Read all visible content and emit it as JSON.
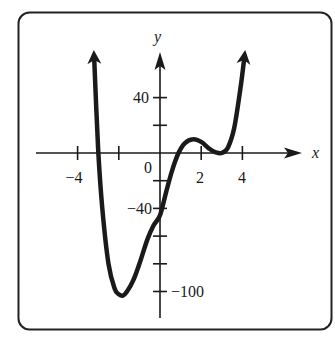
{
  "chart_data": {
    "type": "line",
    "title": "",
    "xlabel": "x",
    "ylabel": "y",
    "xlim": [
      -5.9,
      6.8
    ],
    "ylim": [
      -120,
      73
    ],
    "grid": false,
    "legend": null,
    "x_ticks": [
      -4,
      -2,
      2,
      4
    ],
    "x_tick_labels": [
      "−4",
      "",
      "2",
      "4"
    ],
    "y_ticks": [
      40,
      20,
      -20,
      -40,
      -60,
      -80,
      -100
    ],
    "y_tick_labels": [
      "40",
      "",
      "",
      "−40",
      "",
      "",
      "−100"
    ],
    "origin_label": "0",
    "series": [
      {
        "name": "polynomial curve",
        "color": "#1a1a1a",
        "arrow_ends": true,
        "x": [
          -3.2,
          -3.0,
          -2.8,
          -2.5,
          -2.2,
          -2.0,
          -1.8,
          -1.6,
          -1.3,
          -1.0,
          -0.6,
          -0.3,
          0.0,
          0.3,
          0.6,
          0.9,
          1.2,
          1.6,
          2.0,
          2.4,
          2.7,
          3.0,
          3.3,
          3.6,
          3.9,
          4.1
        ],
        "y": [
          70,
          2,
          -40,
          -80,
          -98,
          -102,
          -103,
          -100,
          -92,
          -80,
          -62,
          -52,
          -45,
          -28,
          -12,
          0,
          7,
          10,
          8,
          3,
          0.5,
          0,
          4,
          18,
          46,
          70
        ]
      }
    ],
    "key_points": {
      "x_intercepts_approx": [
        -3.0,
        1.0,
        3.0
      ],
      "local_min_approx": [
        -1.8,
        -102
      ],
      "local_max_approx": [
        1.6,
        10
      ],
      "touch_point_approx": [
        3.0,
        0
      ],
      "y_intercept_approx": -45
    }
  },
  "labels": {
    "x_axis": "x",
    "y_axis": "y",
    "origin": "0",
    "x_tick_neg4": "−4",
    "x_tick_2": "2",
    "x_tick_4": "4",
    "y_tick_40": "40",
    "y_tick_neg40": "−40",
    "y_tick_neg100": "−100"
  }
}
